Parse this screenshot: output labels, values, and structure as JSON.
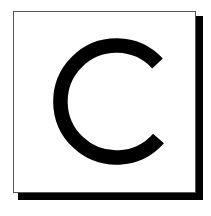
{
  "canvas": {
    "width": 211,
    "height": 216,
    "background_color": "#ffffff"
  },
  "card": {
    "name": "letter-card",
    "background_color": "#ffffff",
    "border_color": "#555555",
    "shadow_color": "#000000",
    "shadow_offset_px": 5,
    "x": 13,
    "y": 11,
    "width": 183,
    "height": 182
  },
  "glyph": {
    "character": "C",
    "label": "Letter C",
    "color": "#000000",
    "style": "geometric-sans-serif",
    "stroke_width_px": 14,
    "bounds": {
      "x": 55,
      "y": 36,
      "width": 102,
      "height": 127
    },
    "terminals": {
      "upper_right": {
        "x": 155,
        "y": 62
      },
      "lower_right": {
        "x": 157,
        "y": 137
      }
    }
  }
}
